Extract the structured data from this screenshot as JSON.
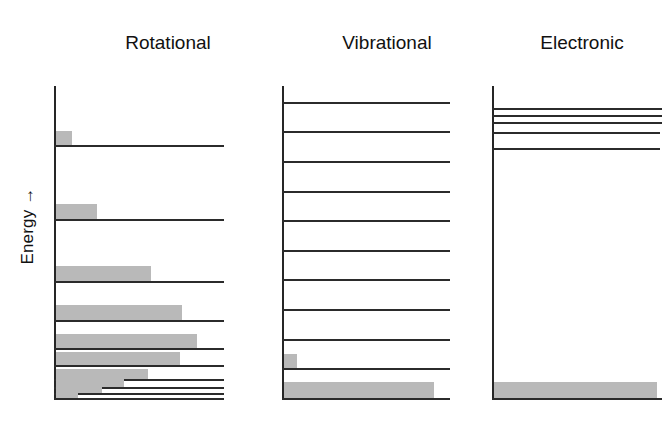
{
  "figure": {
    "axis_label": "Energy →",
    "fill_color": "#b9b9b9",
    "line_color": "#2b2b2b",
    "background": "#ffffff"
  },
  "chart_data": {
    "type": "bar",
    "title": "",
    "subtitle": "",
    "xlabel": "",
    "ylabel": "Energy →",
    "grid": false,
    "legend": "none",
    "panels": [
      {
        "name": "rotational",
        "label": "Rotational",
        "level_count": 10,
        "bar_count": 10,
        "level_positions_pct": [
          19.0,
          42.5,
          62.5,
          75.0,
          84.0,
          89.5,
          93.8,
          96.6,
          98.5,
          100.0
        ],
        "level_widths_pct": [
          100,
          100,
          100,
          100,
          100,
          100,
          100,
          100,
          100,
          100
        ],
        "populations_pct": [
          9.5,
          24.0,
          56.0,
          74.0,
          83.0,
          73.0,
          54.0,
          40.0,
          27.0,
          13.0
        ],
        "bar_heights_px": [
          14,
          15,
          15,
          15,
          14,
          13,
          10,
          8,
          6,
          5
        ]
      },
      {
        "name": "vibrational",
        "label": "Vibrational",
        "level_count": 11,
        "bar_count": 2,
        "level_positions_pct": [
          5.0,
          14.5,
          24.0,
          33.5,
          43.0,
          52.5,
          62.0,
          71.5,
          81.0,
          90.5,
          100.0
        ],
        "level_widths_pct": [
          100,
          100,
          100,
          100,
          100,
          100,
          100,
          100,
          100,
          100,
          100
        ],
        "populations_pct": [
          0,
          0,
          0,
          0,
          0,
          0,
          0,
          0,
          0,
          7.5,
          89.0
        ],
        "bar_heights_px": [
          0,
          0,
          0,
          0,
          0,
          0,
          0,
          0,
          0,
          14,
          16
        ]
      },
      {
        "name": "electronic",
        "label": "Electronic",
        "level_count": 6,
        "bar_count": 1,
        "level_positions_pct": [
          7.0,
          9.3,
          11.6,
          14.6,
          20.0,
          100.0
        ],
        "level_widths_pct": [
          100,
          100,
          100,
          99,
          99,
          100
        ],
        "populations_pct": [
          0,
          0,
          0,
          0,
          0,
          96.0
        ],
        "bar_heights_px": [
          0,
          0,
          0,
          0,
          0,
          16
        ]
      }
    ]
  }
}
